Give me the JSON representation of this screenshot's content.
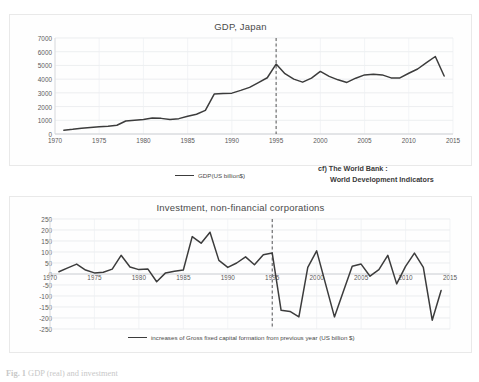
{
  "figure": {
    "caption_number": "Fig. 1",
    "caption_text": "GDP (real) and investment",
    "source_line1": "cf) The World Bank :",
    "source_line2": "World Development Indicators"
  },
  "chart_data": [
    {
      "type": "line",
      "id": "gdp-japan",
      "title": "GDP, Japan",
      "xlabel": "",
      "ylabel": "",
      "xlim": [
        1970,
        2015
      ],
      "ylim": [
        0,
        7000
      ],
      "ytick_step": 1000,
      "xtick_step": 5,
      "grid": true,
      "legend_position": "bottom-center",
      "yticks": [
        0,
        1000,
        2000,
        3000,
        4000,
        5000,
        6000,
        7000
      ],
      "xticks": [
        1970,
        1975,
        1980,
        1985,
        1990,
        1995,
        2000,
        2005,
        2010,
        2015
      ],
      "annotations": [
        {
          "type": "vertical-dashed-line",
          "x": 1995,
          "label": ""
        }
      ],
      "series": [
        {
          "name": "GDP(US billion$)",
          "color": "#3c3c3c",
          "x": [
            1971,
            1972,
            1973,
            1974,
            1975,
            1976,
            1977,
            1978,
            1979,
            1980,
            1981,
            1982,
            1983,
            1984,
            1985,
            1986,
            1987,
            1988,
            1989,
            1990,
            1991,
            1992,
            1993,
            1994,
            1995,
            1996,
            1997,
            1998,
            1999,
            2000,
            2001,
            2002,
            2003,
            2004,
            2005,
            2006,
            2007,
            2008,
            2009,
            2010,
            2011,
            2012,
            2013,
            2014
          ],
          "values": [
            280,
            340,
            420,
            470,
            520,
            570,
            640,
            950,
            1010,
            1060,
            1160,
            1140,
            1060,
            1120,
            1290,
            1440,
            1720,
            2910,
            2960,
            2980,
            3180,
            3400,
            3750,
            4100,
            5100,
            4400,
            4000,
            3780,
            4070,
            4560,
            4200,
            3950,
            3760,
            4070,
            4310,
            4350,
            4310,
            4090,
            4090,
            4430,
            4740,
            5200,
            5650,
            4230
          ]
        }
      ]
    },
    {
      "type": "line",
      "id": "investment-nonfinancial",
      "title": "Investment, non-financial corporations",
      "xlabel": "",
      "ylabel": "",
      "xlim": [
        1970,
        2015
      ],
      "ylim": [
        -250,
        250
      ],
      "ytick_step": 50,
      "xtick_step": 5,
      "grid": true,
      "legend_position": "bottom-center",
      "yticks": [
        250,
        200,
        150,
        100,
        50,
        0,
        -50,
        -100,
        -150,
        -200,
        -250
      ],
      "xticks": [
        1970,
        1975,
        1980,
        1985,
        1990,
        1995,
        2000,
        2005,
        2010,
        2015
      ],
      "annotations": [
        {
          "type": "vertical-dashed-line",
          "x": 1995,
          "label": ""
        }
      ],
      "series": [
        {
          "name": "increases of Gross fixed capital formation from previous year (US billion $)",
          "color": "#3c3c3c",
          "x": [
            1971,
            1972,
            1973,
            1974,
            1975,
            1976,
            1977,
            1978,
            1979,
            1980,
            1981,
            1982,
            1983,
            1984,
            1985,
            1986,
            1987,
            1988,
            1989,
            1990,
            1991,
            1992,
            1993,
            1994,
            1995,
            1996,
            1997,
            1998,
            1999,
            2000,
            2001,
            2002,
            2003,
            2004,
            2005,
            2006,
            2007,
            2008,
            2009,
            2010,
            2011,
            2012,
            2013,
            2014
          ],
          "values": [
            10,
            28,
            45,
            18,
            5,
            8,
            22,
            85,
            32,
            20,
            23,
            -35,
            5,
            12,
            18,
            170,
            140,
            190,
            62,
            30,
            50,
            78,
            42,
            88,
            95,
            -165,
            -170,
            -195,
            30,
            105,
            -45,
            -195,
            -80,
            35,
            45,
            -10,
            20,
            85,
            -45,
            35,
            95,
            30,
            -210,
            -75
          ]
        }
      ]
    }
  ]
}
